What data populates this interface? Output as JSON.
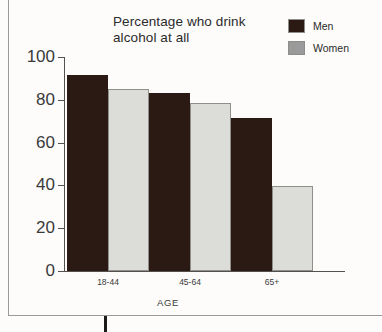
{
  "chart_data": {
    "type": "bar",
    "title": "Percentage who drink alcohol at all",
    "title_line1": "Percentage who drink",
    "title_line2": "alcohol at all",
    "xlabel": "AGE",
    "ylabel": "",
    "categories": [
      "18-44",
      "45-64",
      "65+"
    ],
    "series": [
      {
        "name": "Men",
        "color": "#2b1a14",
        "values": [
          91.5,
          83,
          71.5
        ]
      },
      {
        "name": "Women",
        "color": "#c9c9c5",
        "values": [
          85,
          78.5,
          39.5
        ]
      }
    ],
    "ylim": [
      0,
      100
    ],
    "yticks": [
      0,
      20,
      40,
      60,
      80,
      100
    ],
    "ytick_labels": [
      "0",
      "20",
      "40",
      "60",
      "80",
      "100"
    ],
    "grid": false,
    "legend_position": "top-right"
  },
  "legend": {
    "items": [
      {
        "label": "Men",
        "color": "#2b1a14"
      },
      {
        "label": "Women",
        "color": "#9a9a9a"
      }
    ]
  }
}
